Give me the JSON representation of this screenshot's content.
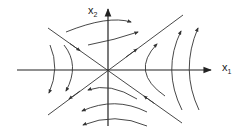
{
  "diagram": {
    "type": "phase-portrait-saddle",
    "axes": {
      "x_label": "x",
      "x_subscript": "1",
      "y_label": "x",
      "y_subscript": "2"
    },
    "colors": {
      "stroke": "#333333",
      "background": "#ffffff"
    },
    "manifolds": [
      {
        "name": "stable-manifold",
        "direction": "toward-origin"
      },
      {
        "name": "unstable-manifold",
        "direction": "away-from-origin"
      }
    ],
    "trajectory_groups": [
      {
        "region": "top",
        "count": 2,
        "flow": "rightward"
      },
      {
        "region": "bottom",
        "count": 3,
        "flow": "leftward"
      },
      {
        "region": "left",
        "count": 2,
        "flow": "downward"
      },
      {
        "region": "right",
        "count": 3,
        "flow": "upward"
      }
    ]
  }
}
